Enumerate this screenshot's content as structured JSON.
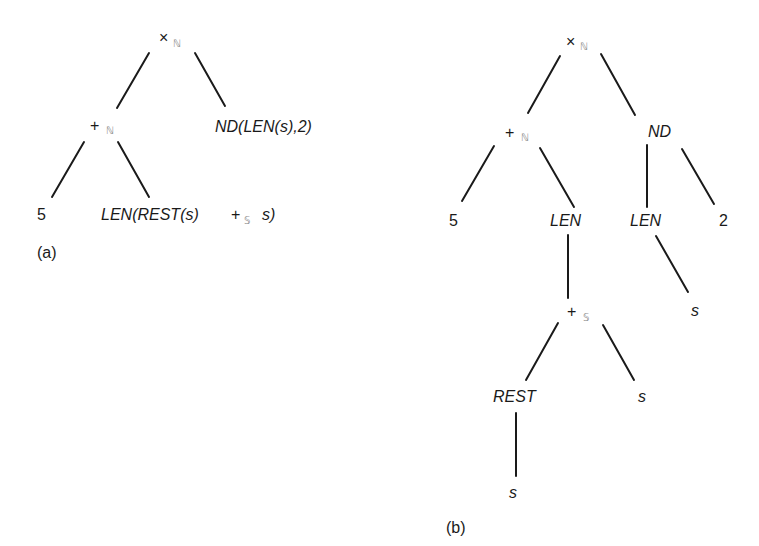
{
  "figure_a": {
    "caption": "(a)",
    "root": {
      "op": "×",
      "sub": "ℕ"
    },
    "plus": {
      "op": "+",
      "sub": "ℕ"
    },
    "right": "ND(LEN(s),2)",
    "leaf_5": "5",
    "leaf_len_pre": "LEN(REST(s)",
    "leaf_len_op": "+",
    "leaf_len_sub": "𝕊",
    "leaf_len_post": "s)"
  },
  "figure_b": {
    "caption": "(b)",
    "root": {
      "op": "×",
      "sub": "ℕ"
    },
    "plus": {
      "op": "+",
      "sub": "ℕ"
    },
    "nd": "ND",
    "leaf_5": "5",
    "len_left": "LEN",
    "len_right": "LEN",
    "leaf_2": "2",
    "s_under_len": "s",
    "plus_s": {
      "op": "+",
      "sub": "𝕊"
    },
    "rest": "REST",
    "s_right": "s",
    "s_under_rest": "s"
  }
}
